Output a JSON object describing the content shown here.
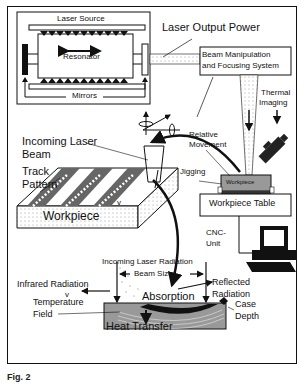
{
  "figure": {
    "caption": "Fig. 2",
    "laser_system": {
      "source_label": "Laser Source",
      "resonator_label": "Resonator",
      "mirrors_label": "Mirrors",
      "output_label": "Laser Output Power",
      "beam_system_label": [
        "Beam Manipulation",
        "and Focusing System"
      ]
    },
    "motion": {
      "relative_movement_label": [
        "Relative",
        "Movement"
      ],
      "thermal_imaging_label": [
        "Thermal",
        "Imaging"
      ],
      "jigging_label": "Jigging",
      "workpiece_small_label": "Workpiece",
      "workpiece_table_label": "Workpiece Table",
      "cnc_label": [
        "CNC-",
        "Unit"
      ]
    },
    "track": {
      "incoming_beam_label": [
        "Incoming Laser",
        "Beam"
      ],
      "track_pattern_label": [
        "Track",
        "Pattern"
      ],
      "workpiece_label": "Workpiece",
      "velocity_label": "v"
    },
    "process": {
      "incoming_radiation_label": "Incoming Laser Radiation",
      "beam_size_label": "Beam Size",
      "infrared_label": "Infrared Radiation",
      "velocity_label": "v",
      "reflected_label": [
        "Reflected",
        "Radiation"
      ],
      "absorption_label": "Absorption",
      "temperature_label": [
        "Temperature",
        "Field"
      ],
      "case_depth_label": [
        "Case",
        "Depth"
      ],
      "heat_transfer_label": "Heat Transfer"
    }
  }
}
